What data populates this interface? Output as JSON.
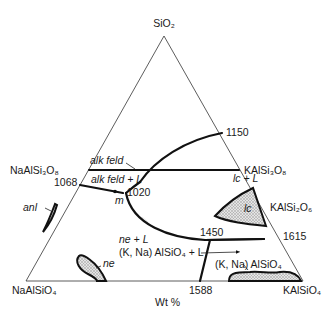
{
  "diagram": {
    "type": "ternary-phase-diagram",
    "units_label": "Wt %",
    "vertices": {
      "top": "SiO₂",
      "bottom_left": "NaAlSiO₄",
      "bottom_right": "KAlSiO₄"
    },
    "compositions": {
      "left_side": "NaAlSi₃O₈",
      "right_side_upper": "KAlSi₃O₈",
      "right_side_lower": "KAlSi₂O₆"
    },
    "temperatures": {
      "t1150": "1150",
      "t1068": "1068",
      "t1020": "1020",
      "t1450": "1450",
      "t1615": "1615",
      "t1588": "1588"
    },
    "fields": {
      "alk_feld": "alk feld",
      "alk_feld_L": "alk feld + L",
      "lc_L": "lc + L",
      "lc": "lc",
      "anl": "anl",
      "ne_L": "ne + L",
      "kna_alsio4_L": "(K, Na) AlSiO₄ + L",
      "kna_alsio4": "(K, Na) AlSiO₄",
      "ne": "ne",
      "m": "m"
    },
    "colors": {
      "line": "#111111",
      "frame": "#333333",
      "shading": "#bdbdbd",
      "background": "#ffffff"
    }
  }
}
